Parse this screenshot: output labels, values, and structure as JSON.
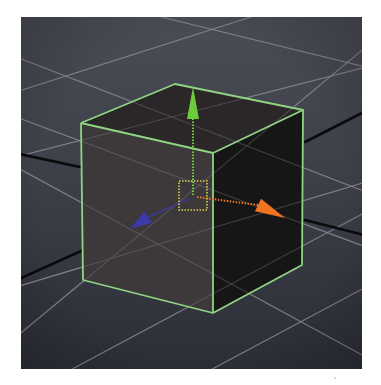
{
  "viewport": {
    "name": "3D perspective viewport",
    "origin": [
      21,
      17
    ],
    "size": [
      341,
      352
    ],
    "background": "#3b3d47"
  },
  "colors": {
    "grid": "#8a8a92",
    "world_axis": "#0a0a0a",
    "selection_outline": "#8fd483",
    "face_left": "#3d393b",
    "face_top": "#2b2728",
    "face_right": "#161616",
    "gizmo_y": "#6ccc3c",
    "gizmo_x": "#f07422",
    "gizmo_z": "#3a3aa8",
    "gizmo_center": "#d8d04a"
  },
  "grid_lines": [
    [
      -5,
      75,
      230,
      0
    ],
    [
      -5,
      140,
      345,
      50
    ],
    [
      -5,
      40,
      345,
      175
    ],
    [
      -5,
      150,
      345,
      340
    ],
    [
      40,
      358,
      345,
      195
    ],
    [
      180,
      358,
      345,
      270
    ],
    [
      140,
      0,
      345,
      50
    ],
    [
      -5,
      270,
      345,
      165
    ],
    [
      -5,
      100,
      345,
      230
    ],
    [
      -5,
      320,
      345,
      30
    ]
  ],
  "world_axes": [
    {
      "label": "axis-left-upper",
      "points": [
        [
          -2,
          137
        ],
        [
          59,
          150
        ]
      ]
    },
    {
      "label": "axis-left-lower",
      "points": [
        [
          -2,
          262
        ],
        [
          111,
          211
        ]
      ]
    },
    {
      "label": "axis-right-upper",
      "points": [
        [
          284,
          125
        ],
        [
          343,
          95
        ]
      ]
    },
    {
      "label": "axis-right-lower",
      "points": [
        [
          284,
          203
        ],
        [
          343,
          218
        ]
      ]
    }
  ],
  "cube": {
    "selected": true,
    "vertices": {
      "top_back": [
        154,
        67
      ],
      "top_left": [
        60,
        106
      ],
      "top_front": [
        192,
        136
      ],
      "top_right": [
        282,
        93
      ],
      "bottom_left": [
        62,
        263
      ],
      "bottom_front": [
        192,
        296
      ],
      "bottom_right": [
        281,
        248
      ]
    }
  },
  "gizmo": {
    "type": "move-tool manipulator",
    "center": [
      174,
      178
    ],
    "center_box": [
      158,
      164,
      28,
      29
    ],
    "y_axis": {
      "from": [
        172,
        178
      ],
      "base": [
        172,
        102
      ],
      "tip": [
        172,
        70
      ],
      "half_width": 6
    },
    "x_axis": {
      "from": [
        176,
        180
      ],
      "base": [
        237,
        188
      ],
      "tip": [
        264,
        201
      ],
      "half_width": 7
    },
    "z_axis": {
      "from": [
        168,
        182
      ],
      "base": [
        127,
        200
      ],
      "tip": [
        109,
        212
      ],
      "half_width": 7
    }
  }
}
